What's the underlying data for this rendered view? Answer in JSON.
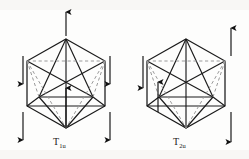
{
  "figure": {
    "kind": "molecular-vibration-diagram",
    "background_color": "#fdfdfc",
    "line_color": "#1a1a1a",
    "dashed_line_color": "#9a9a9a",
    "arrow_color": "#111111",
    "panels": [
      {
        "id": "panel-left",
        "label": "T",
        "label_sub": "1u",
        "polyhedron": "icosahedron",
        "center": [
          66,
          84
        ],
        "radius": 45,
        "arrows": [
          {
            "name": "arrow-top-center",
            "x": 66,
            "y1": 36,
            "y2": 12,
            "direction": "up"
          },
          {
            "name": "arrow-left-upper",
            "x": 23,
            "y1": 56,
            "y2": 84,
            "direction": "down"
          },
          {
            "name": "arrow-left-lower",
            "x": 23,
            "y1": 112,
            "y2": 140,
            "direction": "down"
          },
          {
            "name": "arrow-right-upper",
            "x": 110,
            "y1": 56,
            "y2": 84,
            "direction": "down"
          },
          {
            "name": "arrow-right-lower",
            "x": 110,
            "y1": 112,
            "y2": 140,
            "direction": "down"
          },
          {
            "name": "arrow-center-inner",
            "x": 66,
            "y1": 128,
            "y2": 88,
            "direction": "up"
          }
        ]
      },
      {
        "id": "panel-right",
        "label": "T",
        "label_sub": "2u",
        "polyhedron": "icosahedron",
        "center": [
          186,
          84
        ],
        "radius": 45,
        "arrows": [
          {
            "name": "arrow-left-outer",
            "x": 143,
            "y1": 56,
            "y2": 88,
            "direction": "down"
          },
          {
            "name": "arrow-left-inner",
            "x": 158,
            "y1": 112,
            "y2": 82,
            "direction": "up"
          },
          {
            "name": "arrow-right-upper",
            "x": 231,
            "y1": 56,
            "y2": 28,
            "direction": "up"
          },
          {
            "name": "arrow-right-lower",
            "x": 231,
            "y1": 112,
            "y2": 142,
            "direction": "down"
          }
        ]
      }
    ]
  }
}
